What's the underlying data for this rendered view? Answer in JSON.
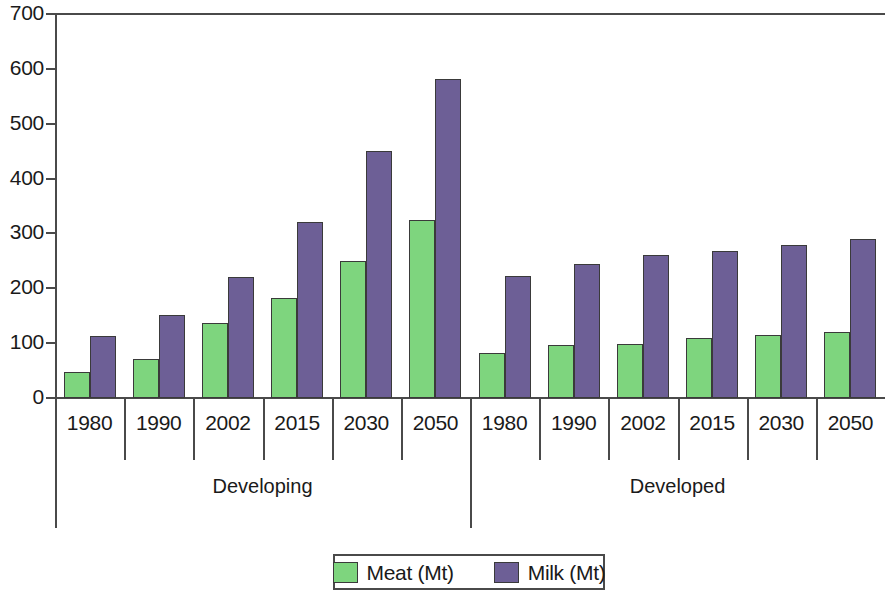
{
  "chart_data": {
    "type": "bar",
    "title": "",
    "subtitle": "",
    "xlabel": "",
    "ylabel": "",
    "ylim": [
      0,
      700
    ],
    "ytick_labels": [
      "700",
      "600",
      "500",
      "400",
      "300",
      "200",
      "100",
      "0"
    ],
    "ytick_values": [
      700,
      600,
      500,
      400,
      300,
      200,
      100,
      0
    ],
    "grid": false,
    "legend_position": "bottom-center",
    "groups": [
      {
        "name": "Developing",
        "categories": [
          "1980",
          "1990",
          "2002",
          "2015",
          "2030",
          "2050"
        ],
        "series": [
          {
            "name": "Meat (Mt)",
            "color": "#7ed57e",
            "values": [
              47,
              72,
              137,
              182,
              250,
              325
            ]
          },
          {
            "name": "Milk (Mt)",
            "color": "#6d5f96",
            "values": [
              113,
              152,
              221,
              321,
              450,
              582
            ]
          }
        ]
      },
      {
        "name": "Developed",
        "categories": [
          "1980",
          "1990",
          "2002",
          "2015",
          "2030",
          "2050"
        ],
        "series": [
          {
            "name": "Meat (Mt)",
            "color": "#7ed57e",
            "values": [
              82,
              97,
              98,
              109,
              115,
              120
            ]
          },
          {
            "name": "Milk (Mt)",
            "color": "#6d5f96",
            "values": [
              223,
              244,
              261,
              268,
              279,
              289
            ]
          }
        ]
      }
    ],
    "legend": [
      {
        "label": "Meat (Mt)",
        "color": "#7ed57e"
      },
      {
        "label": "Milk (Mt)",
        "color": "#6d5f96"
      }
    ]
  },
  "colors": {
    "meat": "#7ed57e",
    "milk": "#6d5f96",
    "axis": "#4a4a4a",
    "text": "#1a1a1a",
    "background": "#ffffff"
  }
}
